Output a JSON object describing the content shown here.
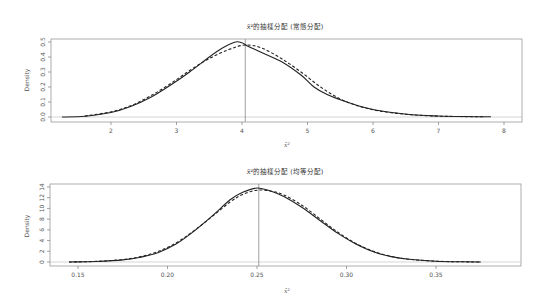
{
  "chart_data": [
    {
      "type": "line",
      "title": "x̄²的抽樣分配 (常態分配)",
      "xlabel": "x̄²",
      "ylabel": "Density",
      "xlim": [
        1.3,
        8.3
      ],
      "ylim": [
        0,
        0.52
      ],
      "x_ticks": [
        2,
        3,
        4,
        5,
        6,
        7,
        8
      ],
      "y_ticks": [
        0.0,
        0.1,
        0.2,
        0.3,
        0.4,
        0.5
      ],
      "y_tick_labels": [
        "0.0",
        "0.1",
        "0.2",
        "0.3",
        "0.4",
        "0.5"
      ],
      "grid": false,
      "vertical_line_x": 4.05,
      "series": [
        {
          "name": "empirical density (solid)",
          "style": "solid",
          "x": [
            1.25,
            1.6,
            2.0,
            2.3,
            2.6,
            2.9,
            3.2,
            3.5,
            3.7,
            3.9,
            4.0,
            4.1,
            4.3,
            4.6,
            4.9,
            5.1,
            5.3,
            5.6,
            5.9,
            6.2,
            6.6,
            7.0,
            7.4,
            7.8
          ],
          "y": [
            0.0,
            0.005,
            0.03,
            0.07,
            0.13,
            0.21,
            0.3,
            0.4,
            0.46,
            0.5,
            0.495,
            0.47,
            0.43,
            0.37,
            0.28,
            0.2,
            0.15,
            0.1,
            0.06,
            0.035,
            0.015,
            0.007,
            0.003,
            0.001
          ]
        },
        {
          "name": "theoretical density (dashed)",
          "style": "dashed",
          "x": [
            1.6,
            2.0,
            2.3,
            2.6,
            2.9,
            3.2,
            3.5,
            3.8,
            4.05,
            4.3,
            4.6,
            4.9,
            5.2,
            5.5,
            5.8,
            6.1,
            6.5,
            6.9,
            7.3,
            7.7
          ],
          "y": [
            0.006,
            0.035,
            0.075,
            0.14,
            0.22,
            0.31,
            0.39,
            0.45,
            0.48,
            0.46,
            0.39,
            0.3,
            0.2,
            0.12,
            0.07,
            0.04,
            0.018,
            0.007,
            0.003,
            0.001
          ]
        }
      ]
    },
    {
      "type": "line",
      "title": "x̄²的抽樣分配 (均等分配)",
      "xlabel": "x̄²",
      "ylabel": "Density",
      "xlim": [
        0.135,
        0.395
      ],
      "ylim": [
        0,
        14.5
      ],
      "x_ticks": [
        0.15,
        0.2,
        0.25,
        0.3,
        0.35
      ],
      "x_tick_labels": [
        "0.15",
        "0.20",
        "0.25",
        "0.30",
        "0.35"
      ],
      "y_ticks": [
        0,
        2,
        4,
        6,
        8,
        10,
        12,
        14
      ],
      "y_tick_labels": [
        "0",
        "2",
        "4",
        "6",
        "8",
        "10",
        "12",
        "14"
      ],
      "grid": false,
      "vertical_line_x": 0.251,
      "series": [
        {
          "name": "empirical density (solid)",
          "style": "solid",
          "x": [
            0.145,
            0.16,
            0.175,
            0.185,
            0.195,
            0.205,
            0.215,
            0.225,
            0.235,
            0.242,
            0.25,
            0.258,
            0.265,
            0.275,
            0.285,
            0.295,
            0.305,
            0.315,
            0.325,
            0.335,
            0.35,
            0.365,
            0.375
          ],
          "y": [
            0.0,
            0.1,
            0.4,
            0.9,
            1.8,
            3.4,
            5.8,
            8.6,
            11.6,
            13.0,
            13.8,
            13.2,
            12.2,
            10.2,
            7.8,
            5.4,
            3.4,
            1.9,
            1.0,
            0.5,
            0.15,
            0.04,
            0.0
          ]
        },
        {
          "name": "theoretical density (dashed)",
          "style": "dashed",
          "x": [
            0.145,
            0.16,
            0.175,
            0.185,
            0.195,
            0.205,
            0.215,
            0.225,
            0.235,
            0.242,
            0.25,
            0.258,
            0.265,
            0.275,
            0.285,
            0.295,
            0.305,
            0.315,
            0.325,
            0.335,
            0.35,
            0.365,
            0.375
          ],
          "y": [
            0.0,
            0.12,
            0.45,
            1.0,
            2.0,
            3.6,
            5.9,
            8.5,
            11.2,
            12.6,
            13.4,
            13.2,
            12.5,
            10.6,
            8.1,
            5.6,
            3.5,
            2.0,
            1.05,
            0.5,
            0.15,
            0.04,
            0.0
          ]
        }
      ]
    }
  ],
  "plots": {
    "top": {
      "title": "x̄²的抽樣分配 (常態分配)",
      "xlabel": "x̄²",
      "ylabel": "Density",
      "xtick_labels": [
        "2",
        "3",
        "4",
        "5",
        "6",
        "7",
        "8"
      ],
      "ytick_labels": [
        "0.0",
        "0.1",
        "0.2",
        "0.3",
        "0.4",
        "0.5"
      ]
    },
    "bottom": {
      "title": "x̄²的抽樣分配 (均等分配)",
      "xlabel": "x̄²",
      "ylabel": "Density",
      "xtick_labels": [
        "0.15",
        "0.20",
        "0.25",
        "0.30",
        "0.35"
      ],
      "ytick_labels": [
        "0",
        "2",
        "4",
        "6",
        "8",
        "10",
        "12",
        "14"
      ]
    }
  }
}
